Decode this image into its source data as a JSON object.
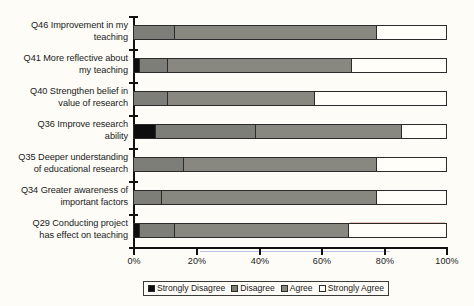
{
  "chart_data": {
    "type": "bar",
    "orientation": "horizontal",
    "stacked": true,
    "normalized_percent": true,
    "title": "",
    "subtitle": "",
    "xlabel": "",
    "ylabel": "",
    "xlim": [
      0,
      100
    ],
    "xticks": [
      "0%",
      "20%",
      "40%",
      "60%",
      "80%",
      "100%"
    ],
    "xtick_values": [
      0,
      20,
      40,
      60,
      80,
      100
    ],
    "grid": false,
    "legend_position": "bottom",
    "legend": [
      "Strongly Disagree",
      "Disagree",
      "Agree",
      "Strongly Agree"
    ],
    "colors": {
      "Strongly Disagree": "#0d0d0d",
      "Disagree": "#7e7e78",
      "Agree": "#888881",
      "Strongly Agree": "#fffef9"
    },
    "categories": [
      "Q46 Improvement in my teaching",
      "Q41 More reflective about my teaching",
      "Q40 Strengthen belief in value of research",
      "Q36 Improve research ability",
      "Q35 Deeper understanding of educational research",
      "Q34 Greater awareness of important factors",
      "Q29 Conducting project has effect on teaching"
    ],
    "series": [
      {
        "name": "Strongly Disagree",
        "values": [
          0,
          2,
          0,
          7,
          0,
          0,
          2
        ]
      },
      {
        "name": "Disagree",
        "values": [
          13,
          9,
          11,
          32,
          16,
          9,
          11
        ]
      },
      {
        "name": "Agree",
        "values": [
          65,
          59,
          47,
          47,
          62,
          69,
          56
        ]
      },
      {
        "name": "Strongly Agree",
        "values": [
          22,
          30,
          42,
          14,
          22,
          22,
          31
        ]
      }
    ],
    "cumulative_boundaries": [
      [
        0,
        13,
        78,
        100
      ],
      [
        2,
        11,
        70,
        100
      ],
      [
        0,
        11,
        58,
        100
      ],
      [
        7,
        39,
        86,
        100
      ],
      [
        0,
        16,
        78,
        100
      ],
      [
        0,
        9,
        78,
        100
      ],
      [
        2,
        13,
        69,
        100
      ]
    ]
  },
  "axis": {
    "x_tick_labels": [
      "0%",
      "20%",
      "40%",
      "60%",
      "80%",
      "100%"
    ]
  },
  "legend": {
    "items": [
      {
        "label": "Strongly Disagree",
        "key": "sd"
      },
      {
        "label": "Disagree",
        "key": "d"
      },
      {
        "label": "Agree",
        "key": "a"
      },
      {
        "label": "Strongly Agree",
        "key": "sa"
      }
    ]
  },
  "categories": [
    {
      "line1": "Q46 Improvement in my",
      "line2": "teaching"
    },
    {
      "line1": "Q41 More reflective about",
      "line2": "my teaching"
    },
    {
      "line1": "Q40 Strengthen belief in",
      "line2": "value of research"
    },
    {
      "line1": "Q36 Improve research",
      "line2": "ability"
    },
    {
      "line1": "Q35 Deeper understanding",
      "line2": "of educational research"
    },
    {
      "line1": "Q34 Greater awareness of",
      "line2": "important factors"
    },
    {
      "line1": "Q29 Conducting project",
      "line2": "has effect on teaching"
    }
  ]
}
